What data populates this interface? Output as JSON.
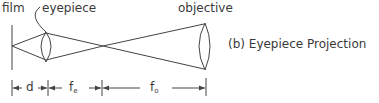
{
  "labels": {
    "film": "film",
    "eyepiece": "eyepiece",
    "objective": "objective",
    "caption": "(b) Eyepiece Projection"
  },
  "dimensions": {
    "d": "d",
    "fe_base": "f",
    "fe_sub": "e",
    "fo_base": "f",
    "fo_sub": "o"
  }
}
